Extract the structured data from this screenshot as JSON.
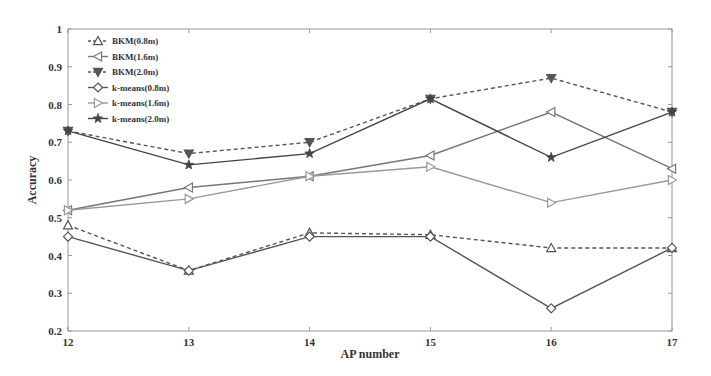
{
  "chart_data": {
    "type": "line",
    "title": "",
    "xlabel": "AP number",
    "ylabel": "Accuracy",
    "x": [
      12,
      13,
      14,
      15,
      16,
      17
    ],
    "xlim": [
      12,
      17
    ],
    "ylim": [
      0.2,
      1.0
    ],
    "yticks": [
      0.2,
      0.3,
      0.4,
      0.5,
      0.6,
      0.7,
      0.8,
      0.9,
      1
    ],
    "ytick_labels": [
      "0.2",
      "0.3",
      "0.4",
      "0.5",
      "0.6",
      "0.7",
      "0.8",
      "0.9",
      "1"
    ],
    "xtick_labels": [
      "12",
      "13",
      "14",
      "15",
      "16",
      "17"
    ],
    "grid": false,
    "legend_position": "upper left",
    "series": [
      {
        "name": "BKM(0.8m)",
        "marker": "triangle-up",
        "dash": true,
        "color": "#555555",
        "values": [
          0.48,
          0.36,
          0.46,
          0.455,
          0.42,
          0.42
        ]
      },
      {
        "name": "BKM(1.6m)",
        "marker": "triangle-left",
        "dash": false,
        "color": "#777777",
        "values": [
          0.52,
          0.58,
          0.61,
          0.665,
          0.78,
          0.63
        ]
      },
      {
        "name": "BKM(2.0m)",
        "marker": "triangle-down",
        "dash": true,
        "color": "#555555",
        "values": [
          0.73,
          0.67,
          0.7,
          0.815,
          0.87,
          0.78
        ]
      },
      {
        "name": "k-means(0.8m)",
        "marker": "diamond",
        "dash": false,
        "color": "#555555",
        "values": [
          0.45,
          0.36,
          0.45,
          0.45,
          0.26,
          0.42
        ]
      },
      {
        "name": "k-means(1.6m)",
        "marker": "triangle-right",
        "dash": false,
        "color": "#999999",
        "values": [
          0.52,
          0.55,
          0.61,
          0.635,
          0.54,
          0.6
        ]
      },
      {
        "name": "k-means(2.0m)",
        "marker": "star",
        "dash": false,
        "color": "#444444",
        "values": [
          0.73,
          0.64,
          0.67,
          0.815,
          0.66,
          0.78
        ]
      }
    ]
  }
}
